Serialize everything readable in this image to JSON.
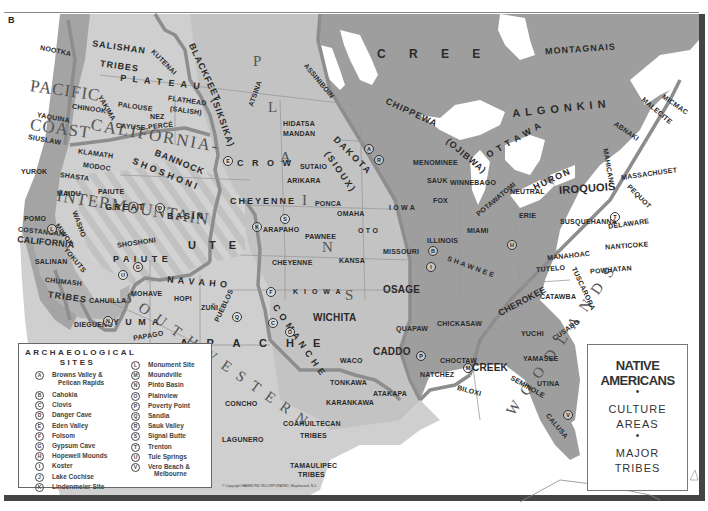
{
  "plate_letter": "B",
  "title_box": {
    "line1": "NATIVE",
    "line2": "AMERICANS",
    "bullet": "•",
    "line3": "CULTURE",
    "line4": "AREAS",
    "line5": "MAJOR",
    "line6": "TRIBES"
  },
  "culture_areas": {
    "pacific": "PACIFIC",
    "coast": "COAST",
    "california_area": "CALIFORNIA-",
    "intermountain": "INTERMOUNTAIN",
    "plateau": "P L A T E A U",
    "plains": [
      "P",
      "L",
      "A",
      "I",
      "N",
      "S"
    ],
    "woodlands": [
      "W",
      "O",
      "O",
      "D",
      "L",
      "A",
      "N",
      "D",
      "S"
    ],
    "southwestern": [
      "S",
      "O",
      "U",
      "T",
      "H",
      "W",
      "E",
      "S",
      "T",
      "E",
      "R",
      "N"
    ]
  },
  "tribes": {
    "nootka": "NOOTKA",
    "salishan": "SALISHAN",
    "tribes1": "TRIBES",
    "kutenai": "KUTENAI",
    "blackfeet": "BLACKFEET",
    "siksika": "(SIKSIKA)",
    "atsina": "ATSINA",
    "assiniboin": "ASSINIBOIN",
    "cree": "C R E E",
    "montagnais": "MONTAGNAIS",
    "chippewa": "CHIPPEWA",
    "ojibwa": "(OJIBWA)",
    "ottawa": "O T T A W A",
    "algonkin": "ALGONKIN",
    "micmac": "MICMAC",
    "malecite": "MALECITE",
    "abnaki": "ABNAKI",
    "mahican": "MAHICAN",
    "massachuset": "MASSACHUSET",
    "pequot": "PEQUOT",
    "yaquina": "YAQUINA",
    "siuslaw": "SIUSLAW",
    "chinook": "CHINOOK",
    "yakima": "YAKIMA",
    "palouse": "PALOUSE",
    "flathead": "FLATHEAD",
    "salish": "(SALISH)",
    "nez_perce": "NEZ",
    "nez_perce2": "PERCÉ",
    "cayuse": "CAYUSE",
    "klamath": "KLAMATH",
    "modoc": "MODOC",
    "bannock": "BANNOCK",
    "shoshoni": "SHOSHONI",
    "crow": "C R O W",
    "hidatsa": "HIDATSA",
    "mandan": "MANDAN",
    "dakota": "DAKOTA",
    "sioux": "(SIOUX)",
    "sutaio": "SUTAIO",
    "arikara": "ARIKARA",
    "menominee": "MENOMINEE",
    "sauk": "SAUK",
    "winnebago": "WINNEBAGO",
    "fox": "FOX",
    "potawatomi": "POTAWATOMI",
    "neutral": "NEUTRAL",
    "huron": "HURON",
    "iroquois": "IROQUOIS",
    "erie": "ERIE",
    "susquehanna": "SUSQUEHANNA",
    "delaware": "DELAWARE",
    "nanticoke": "NANTICOKE",
    "yurok": "YUROK",
    "shasta": "SHASTA",
    "maidu": "MAIDU",
    "paiute1": "PAIUTE",
    "great": "GREAT",
    "basin": "BASIN",
    "cheyenne1": "CHEYENNE",
    "ponca": "PONCA",
    "omaha": "OMAHA",
    "iowa": "I O W A",
    "illinois": "ILLINOIS",
    "miami": "MIAMI",
    "pomo": "POMO",
    "costanoan": "COSTANOAN",
    "california_tribes": "CALIFORNIA",
    "miwok": "MIWOK",
    "washo": "WASHO",
    "yokuts": "YOKUTS",
    "arapaho": "ARAPAHO",
    "pawnee": "PAWNEE",
    "oto": "O T O",
    "missouri": "MISSOURI",
    "shawnee": "S H A W N E E",
    "manahoac": "MANAHOAC",
    "tutelo": "TUTELO",
    "powhatan": "POWHATAN",
    "tuscarora": "TUSCARORA",
    "salinan": "SALINAN",
    "shoshoni2": "SHOSHONI",
    "ute": "U T E",
    "paiute2": "P A I U T E",
    "cheyenne2": "CHEYENNE",
    "kansa": "KANSA",
    "chumash": "CHUMASH",
    "tribes2": "TRIBES",
    "navaho": "N A V A H O",
    "mohave": "MOHAVE",
    "hopi": "HOPI",
    "zuni": "ZUÑI",
    "kiowa": "K I O W A",
    "osage": "OSAGE",
    "catawba": "CATAWBA",
    "cherokee": "CHEROKEE",
    "cahuilla": "CAHUILLA",
    "yuma": "Y U M A",
    "pueblos": "PUEBLOS",
    "comanche": "C O M A N C H E",
    "wichita": "WICHITA",
    "quapaw": "QUAPAW",
    "chickasaw": "CHICKASAW",
    "yuchi": "YUCHI",
    "cusabo": "CUSABO",
    "diegueno": "DIEGUEÑO",
    "papago": "PAPAGO",
    "pima": "PIMA",
    "apache": "A P A C H E",
    "caddo": "CADDO",
    "creek": "CREEK",
    "choctaw": "CHOCTAW",
    "yamasee": "YAMASEE",
    "waco": "WACO",
    "natchez": "NATCHEZ",
    "seminole": "SEMINOLE",
    "utina": "UTINA",
    "biloxi": "BILOXI",
    "tonkawa": "TONKAWA",
    "atakapa": "ATAKAPA",
    "concho": "CONCHO",
    "karankawa": "KARANKAWA",
    "calusa": "CALUSA",
    "coahuiltecan": "COAHUILTECAN",
    "tribes3": "TRIBES",
    "lagunero": "LAGUNERO",
    "tamaulipec": "TAMAULIPEC",
    "tribes4": "TRIBES"
  },
  "legend": {
    "title_line1": "ARCHAEOLOGICAL",
    "title_line2": "SITES",
    "sites_left": [
      {
        "letter": "A",
        "name": "Browns Valley &",
        "name2": "Pelican Rapids"
      },
      {
        "letter": "B",
        "name": "Cahokia"
      },
      {
        "letter": "C",
        "name": "Clovis"
      },
      {
        "letter": "D",
        "name": "Danger Cave"
      },
      {
        "letter": "E",
        "name": "Eden Valley"
      },
      {
        "letter": "F",
        "name": "Folsom"
      },
      {
        "letter": "G",
        "name": "Gypsum Cave"
      },
      {
        "letter": "H",
        "name": "Hopewell Mounds"
      },
      {
        "letter": "I",
        "name": "Koster"
      },
      {
        "letter": "J",
        "name": "Lake Cochise"
      },
      {
        "letter": "K",
        "name": "Lindenmeier Site"
      }
    ],
    "sites_right": [
      {
        "letter": "L",
        "name": "Monument Site"
      },
      {
        "letter": "M",
        "name": "Moundville"
      },
      {
        "letter": "N",
        "name": "Pinto Basin"
      },
      {
        "letter": "O",
        "name": "Plainview"
      },
      {
        "letter": "P",
        "name": "Poverty Point"
      },
      {
        "letter": "Q",
        "name": "Sandia"
      },
      {
        "letter": "R",
        "name": "Sauk Valley"
      },
      {
        "letter": "S",
        "name": "Signal Butte"
      },
      {
        "letter": "T",
        "name": "Trenton"
      },
      {
        "letter": "U",
        "name": "Tule Springs"
      },
      {
        "letter": "V",
        "name": "Vero Beach &",
        "name2": "Melbourne"
      }
    ]
  },
  "site_markers": {
    "A": "A",
    "B": "B",
    "C": "C",
    "D": "D",
    "E": "E",
    "F": "F",
    "G": "G",
    "H": "H",
    "I": "I",
    "J": "J",
    "K": "K",
    "L": "L",
    "M": "M",
    "N": "N",
    "O": "O",
    "P": "P",
    "Q": "Q",
    "R": "R",
    "S": "S",
    "T": "T",
    "U": "U",
    "V": "V"
  },
  "copyright": "© Copyright HAMMOND INCORPORATED, Maplewood, N.J.",
  "colors": {
    "ocean": "#ffffff",
    "woodlands_fill": "#9a9a9a",
    "plains_fill": "#c4c4c4",
    "west_fill": "#d0d0d0",
    "pacific_fill": "#9e9e9e",
    "canada_fill": "#9c9c9c",
    "boundary": "#8a8a8a",
    "text": "#2a2a2a"
  }
}
